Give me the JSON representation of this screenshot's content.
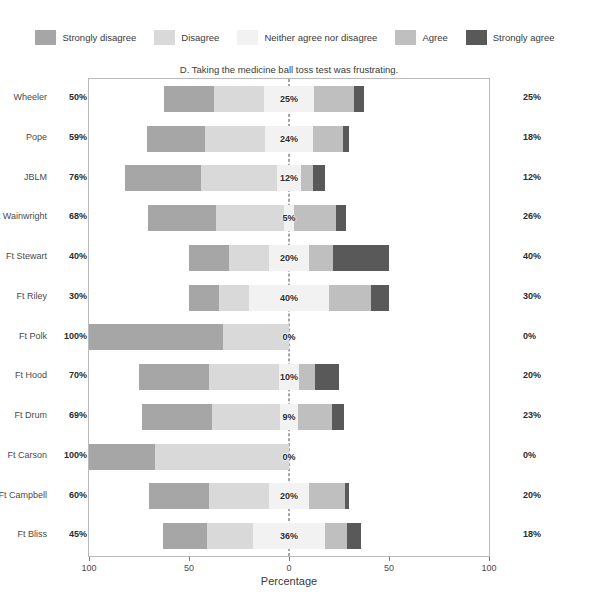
{
  "legend": {
    "items": [
      {
        "label": "Strongly disagree",
        "color": "#a6a6a6"
      },
      {
        "label": "Disagree",
        "color": "#d9d9d9"
      },
      {
        "label": "Neither agree nor disagree",
        "color": "#f2f2f2"
      },
      {
        "label": "Agree",
        "color": "#bfbfbf"
      },
      {
        "label": "Strongly agree",
        "color": "#595959"
      }
    ]
  },
  "chart_data": {
    "type": "bar",
    "subtype": "diverging-stacked-likert",
    "title": "D. Taking the medicine ball toss test was frustrating.",
    "xlabel": "Percentage",
    "ylabel": "",
    "xlim": [
      -100,
      100
    ],
    "xticks": [
      -100,
      -50,
      0,
      50,
      100
    ],
    "xticklabels": [
      "100",
      "50",
      "0",
      "50",
      "100"
    ],
    "grid": false,
    "legend_position": "top",
    "zero_line": true,
    "categories": [
      "Wheeler",
      "Pope",
      "JBLM",
      "Ft Wainwright",
      "Ft Stewart",
      "Ft Riley",
      "Ft Polk",
      "Ft Hood",
      "Ft Drum",
      "Ft Carson",
      "Ft Campbell",
      "Ft Bliss"
    ],
    "series": [
      {
        "name": "Strongly disagree",
        "color": "#a6a6a6",
        "values": [
          25,
          29,
          38,
          34,
          20,
          15,
          67,
          35,
          35,
          33,
          30,
          22
        ]
      },
      {
        "name": "Disagree",
        "color": "#d9d9d9",
        "values": [
          25,
          30,
          38,
          34,
          20,
          15,
          33,
          35,
          34,
          67,
          30,
          23
        ]
      },
      {
        "name": "Neither agree nor disagree",
        "color": "#f2f2f2",
        "values": [
          25,
          24,
          12,
          5,
          20,
          40,
          0,
          10,
          9,
          0,
          20,
          36
        ]
      },
      {
        "name": "Agree",
        "color": "#bfbfbf",
        "values": [
          20,
          15,
          6,
          21,
          12,
          21,
          0,
          8,
          17,
          0,
          18,
          11
        ]
      },
      {
        "name": "Strongly agree",
        "color": "#595959",
        "values": [
          5,
          3,
          6,
          5,
          28,
          9,
          0,
          12,
          6,
          0,
          2,
          7
        ]
      }
    ],
    "left_totals": [
      "50%",
      "59%",
      "76%",
      "68%",
      "40%",
      "30%",
      "100%",
      "70%",
      "69%",
      "100%",
      "60%",
      "45%"
    ],
    "center_values": [
      "25%",
      "24%",
      "12%",
      "5%",
      "20%",
      "40%",
      "0%",
      "10%",
      "9%",
      "0%",
      "20%",
      "36%"
    ],
    "right_totals": [
      "25%",
      "18%",
      "12%",
      "26%",
      "40%",
      "30%",
      "0%",
      "20%",
      "23%",
      "0%",
      "20%",
      "18%"
    ]
  }
}
